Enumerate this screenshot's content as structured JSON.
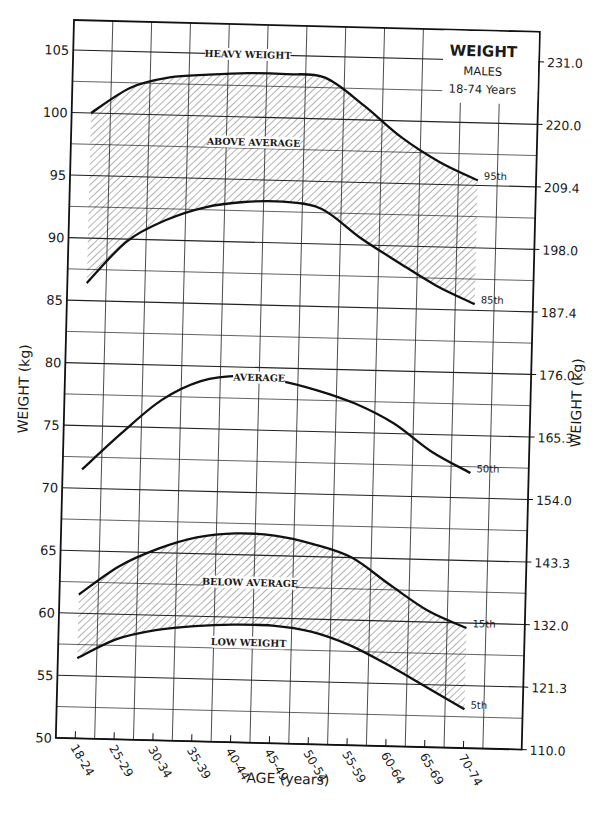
{
  "chart_data": {
    "type": "line",
    "title": "WEIGHT",
    "subtitle_lines": [
      "MALES",
      "18-74 Years"
    ],
    "xlabel": "AGE (years)",
    "ylabel": "WEIGHT (kg)",
    "ylabel_right": "WEIGHT (kg)",
    "categories": [
      "18-24",
      "25-29",
      "30-34",
      "35-39",
      "40-44",
      "45-49",
      "50-54",
      "55-59",
      "60-64",
      "65-69",
      "70-74"
    ],
    "ylim": [
      50,
      107.4
    ],
    "yticks_left": [
      50,
      55,
      60,
      65,
      70,
      75,
      80,
      85,
      90,
      95,
      100,
      105
    ],
    "yticks_right": [
      {
        "value": 50,
        "label": "110.0"
      },
      {
        "value": 55,
        "label": "121.3"
      },
      {
        "value": 60,
        "label": "132.0"
      },
      {
        "value": 65,
        "label": "143.3"
      },
      {
        "value": 70,
        "label": "154.0"
      },
      {
        "value": 75,
        "label": "165.3"
      },
      {
        "value": 80,
        "label": "176.0"
      },
      {
        "value": 85,
        "label": "187.4"
      },
      {
        "value": 90,
        "label": "198.0"
      },
      {
        "value": 95,
        "label": "209.4"
      },
      {
        "value": 100,
        "label": "220.0"
      },
      {
        "value": 105,
        "label": "231.0"
      }
    ],
    "grid": true,
    "minor_grid_step": 2.5,
    "series": [
      {
        "name": "95th",
        "values": [
          100.0,
          102.1,
          103.0,
          103.3,
          103.5,
          103.5,
          103.3,
          101.2,
          98.7,
          96.8,
          95.4
        ]
      },
      {
        "name": "85th",
        "values": [
          86.4,
          89.8,
          91.6,
          92.7,
          93.2,
          93.3,
          92.8,
          90.6,
          88.7,
          86.9,
          85.5
        ]
      },
      {
        "name": "50th",
        "values": [
          71.5,
          74.5,
          77.2,
          78.8,
          79.3,
          79.0,
          78.3,
          77.3,
          75.8,
          73.6,
          72.0
        ]
      },
      {
        "name": "15th",
        "values": [
          61.5,
          63.8,
          65.3,
          66.3,
          66.7,
          66.6,
          66.0,
          65.0,
          62.9,
          60.9,
          59.6
        ]
      },
      {
        "name": "5th",
        "values": [
          56.4,
          58.0,
          58.8,
          59.2,
          59.4,
          59.4,
          59.0,
          58.0,
          56.5,
          54.8,
          53.1
        ]
      }
    ],
    "shaded_bands": [
      {
        "name": "above-average",
        "upper": "95th",
        "lower": "85th"
      },
      {
        "name": "below-average",
        "upper": "15th",
        "lower": "5th"
      }
    ],
    "annotations": [
      {
        "text": "HEAVY WEIGHT",
        "x_index": 4.0,
        "y": 105.0
      },
      {
        "text": "ABOVE AVERAGE",
        "x_index": 4.2,
        "y": 98.0
      },
      {
        "text": "AVERAGE",
        "x_index": 4.5,
        "y": 79.2
      },
      {
        "text": "BELOW AVERAGE",
        "x_index": 4.4,
        "y": 62.8
      },
      {
        "text": "LOW WEIGHT",
        "x_index": 4.4,
        "y": 58.0
      }
    ],
    "legend": "none"
  }
}
